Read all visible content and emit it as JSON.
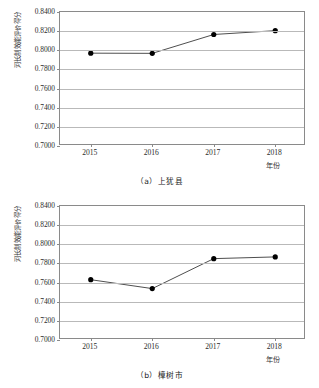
{
  "chart_data": [
    {
      "type": "line",
      "title": "（a）上犹县",
      "caption": "（a）上犹县",
      "xlabel": "年份",
      "ylabel": "河长制效能评价得分",
      "categories": [
        "2015",
        "2016",
        "2017",
        "2018"
      ],
      "values": [
        0.797,
        0.7968,
        0.8165,
        0.8205
      ],
      "ylim": [
        0.7,
        0.84
      ],
      "yticks": [
        "0.8400",
        "0.8200",
        "0.8000",
        "0.7800",
        "0.7600",
        "0.7400",
        "0.7200",
        "0.7000"
      ],
      "ytick_values": [
        0.84,
        0.82,
        0.8,
        0.78,
        0.76,
        0.74,
        0.72,
        0.7
      ],
      "grid": true,
      "legend": "none",
      "line_color": "#3a3a3a",
      "marker_color": "#000000"
    },
    {
      "type": "line",
      "title": "（b）樟树市",
      "caption": "（b）樟树市",
      "xlabel": "年份",
      "ylabel": "河长制效能评价得分",
      "categories": [
        "2015",
        "2016",
        "2017",
        "2018"
      ],
      "values": [
        0.763,
        0.7537,
        0.785,
        0.7868
      ],
      "ylim": [
        0.7,
        0.84
      ],
      "yticks": [
        "0.8400",
        "0.8200",
        "0.8000",
        "0.7800",
        "0.7600",
        "0.7400",
        "0.7200",
        "0.7000"
      ],
      "ytick_values": [
        0.84,
        0.82,
        0.8,
        0.78,
        0.76,
        0.74,
        0.72,
        0.7
      ],
      "grid": true,
      "legend": "none",
      "line_color": "#3a3a3a",
      "marker_color": "#000000"
    }
  ]
}
